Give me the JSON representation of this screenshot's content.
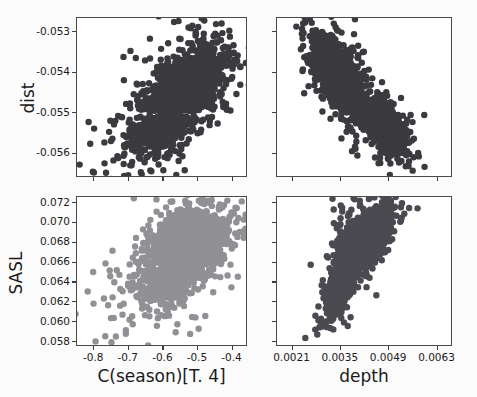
{
  "figure": {
    "type": "scatter-plot-matrix",
    "background_color": "#fbfbfb",
    "panel_background": "#ffffff",
    "frame_color": "#4a4a4a"
  },
  "labels": {
    "y_top": "dist",
    "y_bottom": "SASL",
    "x_left": "C(season)[T. 4]",
    "x_right": "depth"
  },
  "chart_data": [
    {
      "id": "dist-vs-season",
      "type": "scatter",
      "title": "",
      "xlabel": "C(season)[T. 4]",
      "ylabel": "dist",
      "xlim": [
        -0.85,
        -0.355
      ],
      "ylim": [
        -0.0566,
        -0.05265
      ],
      "xticks": [
        -0.8,
        -0.7,
        -0.6,
        -0.5,
        -0.4
      ],
      "xticklabels": [
        "",
        "",
        "",
        "",
        ""
      ],
      "yticks": [
        -0.053,
        -0.054,
        -0.055,
        -0.056
      ],
      "yticklabels": [
        "-0.053",
        "-0.054",
        "-0.055",
        "-0.056"
      ],
      "grid": false,
      "marker_color": "#3a3a3f",
      "marker_size": 3.2,
      "n_points": 2600,
      "correlation": 0.52,
      "distribution": "unimodal-elongated",
      "center": [
        -0.545,
        -0.05455
      ],
      "spread": [
        0.072,
        0.00072
      ],
      "tail": "lower-left"
    },
    {
      "id": "dist-vs-depth",
      "type": "scatter",
      "title": "",
      "xlabel": "depth",
      "ylabel": "dist",
      "xlim": [
        0.00165,
        0.00675
      ],
      "ylim": [
        -0.0566,
        -0.05265
      ],
      "xticks": [
        0.0021,
        0.0035,
        0.0049,
        0.0063
      ],
      "xticklabels": [
        "",
        "",
        "",
        ""
      ],
      "yticks": [
        -0.053,
        -0.054,
        -0.055,
        -0.056
      ],
      "yticklabels": [
        "",
        "",
        "",
        ""
      ],
      "grid": false,
      "marker_color": "#3a3a3f",
      "marker_size": 3.2,
      "n_points": 2600,
      "correlation": -0.82,
      "distribution": "bimodal-negative",
      "cluster_1": {
        "center": [
          0.00345,
          -0.05405
        ],
        "weight": 0.62
      },
      "cluster_2": {
        "center": [
          0.00475,
          -0.0553
        ],
        "weight": 0.38
      }
    },
    {
      "id": "sasl-vs-season",
      "type": "scatter",
      "title": "",
      "xlabel": "C(season)[T. 4]",
      "ylabel": "SASL",
      "xlim": [
        -0.85,
        -0.355
      ],
      "ylim": [
        0.0575,
        0.0726
      ],
      "xticks": [
        -0.8,
        -0.7,
        -0.6,
        -0.5,
        -0.4
      ],
      "xticklabels": [
        "-0.8",
        "-0.7",
        "-0.6",
        "-0.5",
        "-0.4"
      ],
      "yticks": [
        0.072,
        0.07,
        0.068,
        0.066,
        0.064,
        0.062,
        0.06,
        0.058
      ],
      "yticklabels": [
        "0.072",
        "0.070",
        "0.068",
        "0.066",
        "0.064",
        "0.062",
        "0.060",
        "0.058"
      ],
      "grid": false,
      "marker_color": "#909095",
      "marker_size": 3.2,
      "n_points": 2600,
      "correlation": 0.34,
      "distribution": "unimodal-skewed",
      "center": [
        -0.535,
        0.0672
      ],
      "spread": [
        0.07,
        0.0026
      ],
      "tail": "lower-left"
    },
    {
      "id": "sasl-vs-depth",
      "type": "scatter",
      "title": "",
      "xlabel": "depth",
      "ylabel": "SASL",
      "xlim": [
        0.00165,
        0.00675
      ],
      "ylim": [
        0.0575,
        0.0726
      ],
      "xticks": [
        0.0021,
        0.0035,
        0.0049,
        0.0063
      ],
      "xticklabels": [
        "0.0021",
        "0.0035",
        "0.0049",
        "0.0063"
      ],
      "yticks": [
        0.072,
        0.07,
        0.068,
        0.066,
        0.064,
        0.062,
        0.06,
        0.058
      ],
      "yticklabels": [
        "",
        "",
        "",
        "",
        "",
        "",
        "",
        ""
      ],
      "grid": false,
      "marker_color": "#4a4a50",
      "marker_size": 3.2,
      "n_points": 2600,
      "correlation": 0.78,
      "distribution": "bimodal-positive",
      "cluster_1": {
        "center": [
          0.00365,
          0.0655
        ],
        "weight": 0.6
      },
      "cluster_2": {
        "center": [
          0.00448,
          0.069
        ],
        "weight": 0.4
      }
    }
  ],
  "ticks": {
    "dist_y": [
      "-0.053",
      "-0.054",
      "-0.055",
      "-0.056"
    ],
    "sasl_y": [
      "0.072",
      "0.070",
      "0.068",
      "0.066",
      "0.064",
      "0.062",
      "0.060",
      "0.058"
    ],
    "season_x": [
      "-0.8",
      "-0.7",
      "-0.6",
      "-0.5",
      "-0.4"
    ],
    "depth_x": [
      "0.0021",
      "0.0035",
      "0.0049",
      "0.0063"
    ]
  }
}
